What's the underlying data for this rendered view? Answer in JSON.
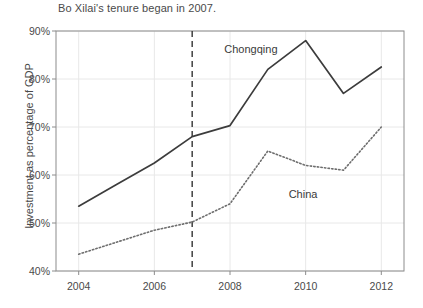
{
  "chart_data": {
    "type": "line",
    "title": "Bo Xilai's tenure began in 2007.",
    "xlabel": "",
    "ylabel": "Investment as percentage of GDP",
    "x": [
      2004,
      2005,
      2006,
      2007,
      2008,
      2009,
      2010,
      2011,
      2012
    ],
    "xlim": [
      2003.4,
      2012.6
    ],
    "ylim": [
      40,
      90
    ],
    "xticks": [
      2004,
      2006,
      2008,
      2010,
      2012
    ],
    "xtick_labels": [
      "2004",
      "2006",
      "2008",
      "2010",
      "2012"
    ],
    "yticks": [
      40,
      50,
      60,
      70,
      80,
      90
    ],
    "ytick_labels": [
      "40%",
      "50%",
      "60%",
      "70%",
      "80%",
      "90%"
    ],
    "grid": true,
    "legend_position": "inline-annotations",
    "series": [
      {
        "name": "Chongqing",
        "style": "solid",
        "color": "#3c3c3c",
        "label_x": 2007.85,
        "label_y": 86.0,
        "values": [
          53.5,
          58.0,
          62.5,
          68.0,
          70.3,
          82.0,
          88.0,
          77.0,
          82.5
        ]
      },
      {
        "name": "China",
        "style": "dotted",
        "color": "#6e6e6e",
        "label_x": 2009.55,
        "label_y": 55.8,
        "values": [
          43.5,
          46.0,
          48.5,
          50.2,
          54.0,
          65.0,
          62.0,
          61.0,
          70.0
        ]
      }
    ],
    "annotations": [
      {
        "name": "tenure-start-marker",
        "type": "vline",
        "x": 2007,
        "style": "dashed",
        "color": "#333333"
      }
    ]
  },
  "colors": {
    "plot_border": "#8c8c8c",
    "gridline": "#e8e8e8",
    "text": "#4a4a4a",
    "background": "#ffffff"
  }
}
